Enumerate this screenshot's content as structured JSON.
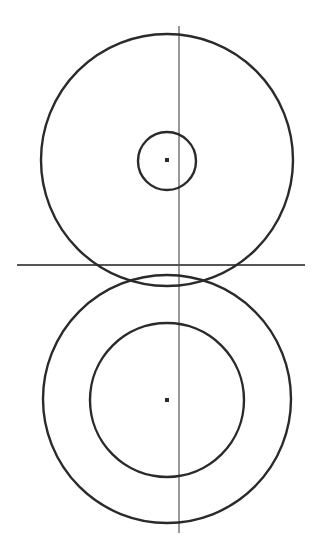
{
  "diagram": {
    "title": "",
    "stroke_color": "#2a2a2a",
    "axis_color": "#555555",
    "background": "#ffffff",
    "vertical_axis": {
      "x": 179,
      "y1": 26,
      "y2": 533
    },
    "horizontal_axis": {
      "y": 265,
      "x1": 17,
      "x2": 305
    },
    "top_group": {
      "outer_circle": {
        "cx": 167,
        "cy": 160,
        "r": 126
      },
      "inner_circle": {
        "cx": 167,
        "cy": 161,
        "r": 29
      },
      "center_point": {
        "cx": 167,
        "cy": 160
      }
    },
    "bottom_group": {
      "outer_circle": {
        "cx": 167,
        "cy": 399,
        "r": 124
      },
      "inner_circle": {
        "cx": 167,
        "cy": 400,
        "r": 77
      },
      "center_point": {
        "cx": 167,
        "cy": 400
      }
    }
  }
}
